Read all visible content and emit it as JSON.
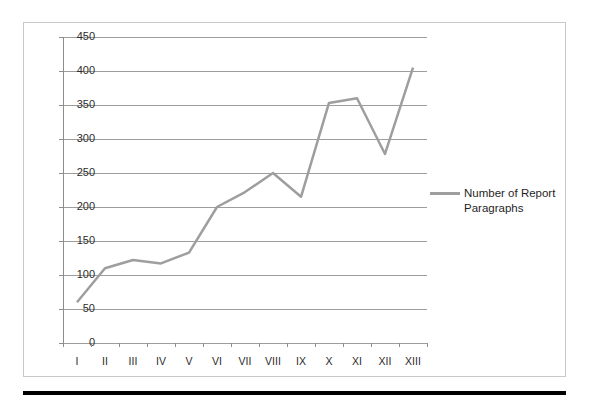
{
  "legend": {
    "label": "Number of Report Paragraphs",
    "swatch_color": "#9e9e9e",
    "position": "right"
  },
  "axes": {
    "y_ticks": [
      "450",
      "400",
      "350",
      "300",
      "250",
      "200",
      "150",
      "100",
      "50",
      "0"
    ],
    "x_ticks": [
      "I",
      "II",
      "III",
      "IV",
      "V",
      "VI",
      "VII",
      "VIII",
      "IX",
      "X",
      "XI",
      "XII",
      "XIII"
    ]
  },
  "colors": {
    "series_line": "#9e9e9e",
    "gridline": "#9d9d9d",
    "axis_line": "#8d8d8d",
    "frame_border": "#c9c9c9",
    "bottom_rule": "#000000",
    "text": "#2b2b2b"
  },
  "chart_data": {
    "type": "line",
    "title": "",
    "subtitle": "",
    "xlabel": "",
    "ylabel": "",
    "categories": [
      "I",
      "II",
      "III",
      "IV",
      "V",
      "VI",
      "VII",
      "VIII",
      "IX",
      "X",
      "XI",
      "XII",
      "XIII"
    ],
    "series": [
      {
        "name": "Number of Report Paragraphs",
        "color": "#9e9e9e",
        "values": [
          60,
          110,
          122,
          117,
          133,
          200,
          222,
          250,
          215,
          353,
          360,
          278,
          405
        ]
      }
    ],
    "ylim": [
      0,
      450
    ],
    "ytick_step": 50,
    "grid": true,
    "grid_axis": "y",
    "legend": true,
    "legend_position": "right",
    "markers": false
  }
}
